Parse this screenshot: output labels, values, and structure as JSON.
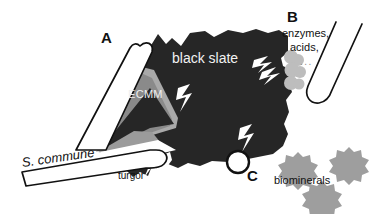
{
  "figure": {
    "background_color": "#ffffff",
    "slate_color": "#262626",
    "ecmm_light_color": "#a9a9a9",
    "ecmm_mid_color": "#8a8a8a",
    "cloud_color": "#bdbdbd",
    "biomineral_color": "#9e9e9e",
    "outline_color": "#111111",
    "crack_color": "#ffffff"
  },
  "labels": {
    "panel_a": "A",
    "panel_b": "B",
    "panel_c": "C",
    "substrate": "black slate",
    "matrix": "ECMM",
    "organism": "S. commune",
    "force": "turgor",
    "secretions_line1": "enzymes,",
    "secretions_line2": "acids,",
    "secretions_line3": "...",
    "minerals": "biominerals"
  },
  "elements": {
    "hypha_upper": "hypha-upper-outline",
    "hypha_lower": "hypha-lower-outline",
    "hypha_right": "hypha-right-tube",
    "slate_body": "black-slate-mass",
    "ecmm_wedge": "extracellular-mucilaginous-matrix",
    "cracks": "slate-fracture-bolts",
    "turgor_arrow": "turgor-pressure-wedge",
    "pore_circle": "biomineral-pore-circle",
    "clouds": "enzyme-acid-cloud",
    "stars": "biomineral-crystals"
  }
}
